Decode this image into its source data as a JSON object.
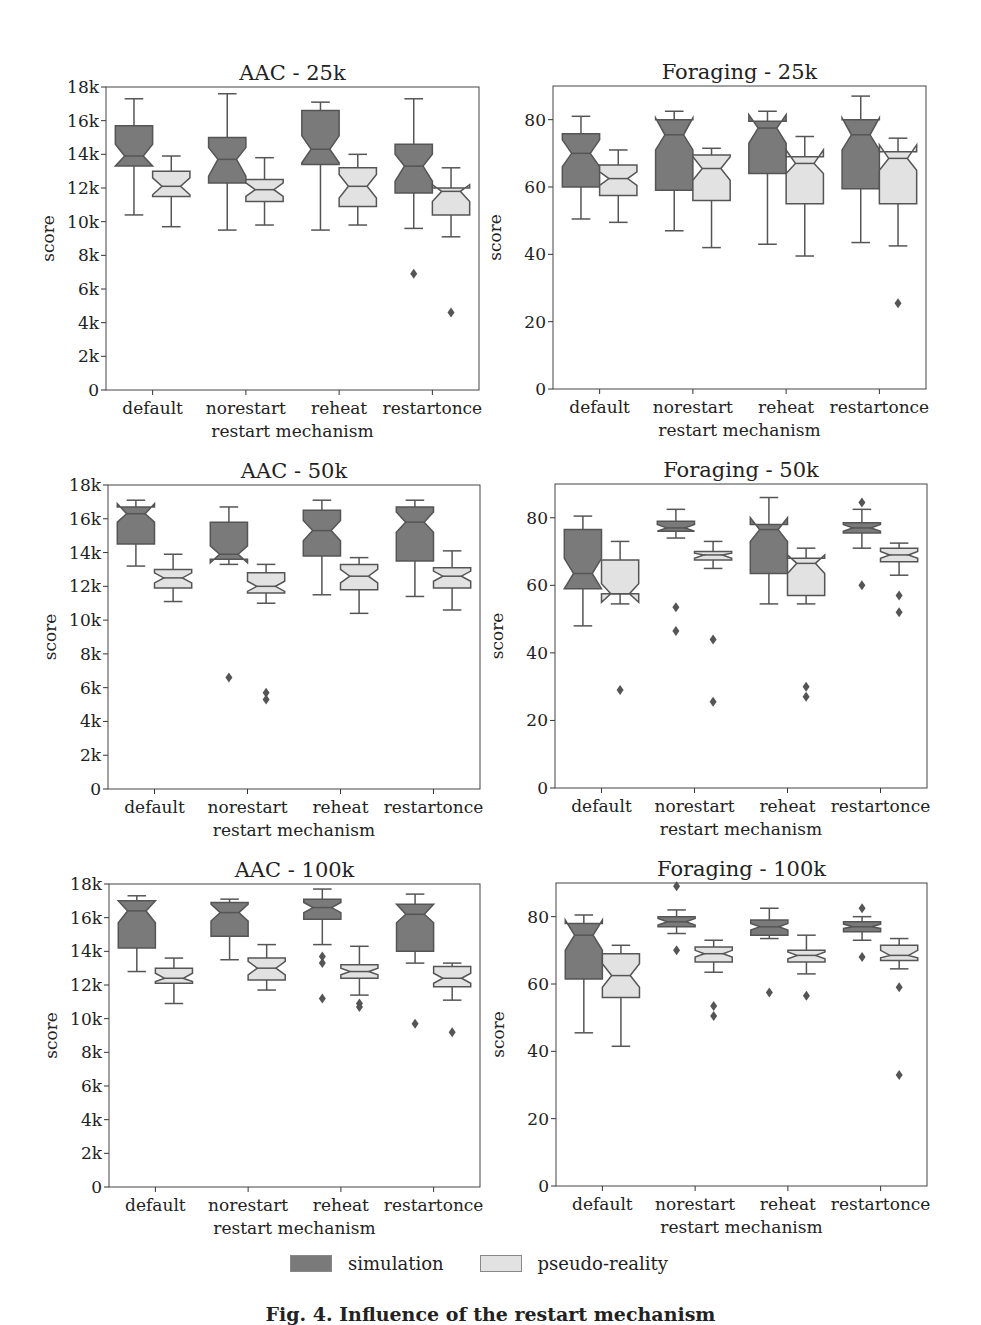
{
  "figure": {
    "caption": "Fig. 4. Influence of the restart mechanism",
    "colors": {
      "simulation": "#7a7a7a",
      "pseudo_reality": "#e2e2e2",
      "edge": "#555555"
    },
    "legend": [
      {
        "label": "simulation",
        "color": "#7a7a7a"
      },
      {
        "label": "pseudo-reality",
        "color": "#e2e2e2"
      }
    ]
  },
  "chart_data": [
    {
      "type": "box",
      "title": "AAC - 25k",
      "xlabel": "restart mechanism",
      "ylabel": "score",
      "ylim": [
        0,
        18000
      ],
      "yticks": [
        0,
        2000,
        4000,
        6000,
        8000,
        10000,
        12000,
        14000,
        16000,
        18000
      ],
      "yticklabels": [
        "0",
        "2k",
        "4k",
        "6k",
        "8k",
        "10k",
        "12k",
        "14k",
        "16k",
        "18k"
      ],
      "categories": [
        "default",
        "norestart",
        "reheat",
        "restartonce"
      ],
      "series": [
        {
          "name": "simulation",
          "boxes": [
            {
              "wlo": 10400,
              "q1": 13300,
              "med": 13900,
              "q3": 15700,
              "whi": 17300,
              "nlo": 13300,
              "nhi": 14600,
              "out": []
            },
            {
              "wlo": 9500,
              "q1": 12300,
              "med": 13700,
              "q3": 15000,
              "whi": 17600,
              "nlo": 12700,
              "nhi": 14400,
              "out": []
            },
            {
              "wlo": 9500,
              "q1": 13400,
              "med": 14300,
              "q3": 16600,
              "whi": 17100,
              "nlo": 13500,
              "nhi": 15100,
              "out": []
            },
            {
              "wlo": 9600,
              "q1": 11700,
              "med": 13300,
              "q3": 14600,
              "whi": 17300,
              "nlo": 12400,
              "nhi": 14000,
              "out": [
                6900
              ]
            }
          ]
        },
        {
          "name": "pseudo-reality",
          "boxes": [
            {
              "wlo": 9700,
              "q1": 11500,
              "med": 12100,
              "q3": 13000,
              "whi": 13900,
              "nlo": 11600,
              "nhi": 12600,
              "out": []
            },
            {
              "wlo": 9800,
              "q1": 11200,
              "med": 11900,
              "q3": 12500,
              "whi": 13800,
              "nlo": 11500,
              "nhi": 12300,
              "out": []
            },
            {
              "wlo": 9800,
              "q1": 10900,
              "med": 12100,
              "q3": 13200,
              "whi": 14000,
              "nlo": 11400,
              "nhi": 12800,
              "out": []
            },
            {
              "wlo": 9100,
              "q1": 10400,
              "med": 11800,
              "q3": 12000,
              "whi": 13200,
              "nlo": 11200,
              "nhi": 12200,
              "out": [
                4600
              ]
            }
          ]
        }
      ]
    },
    {
      "type": "box",
      "title": "Foraging - 25k",
      "xlabel": "restart mechanism",
      "ylabel": "score",
      "ylim": [
        0,
        90
      ],
      "yticks": [
        0,
        20,
        40,
        60,
        80
      ],
      "yticklabels": [
        "0",
        "20",
        "40",
        "60",
        "80"
      ],
      "categories": [
        "default",
        "norestart",
        "reheat",
        "restartonce"
      ],
      "series": [
        {
          "name": "simulation",
          "boxes": [
            {
              "wlo": 50.5,
              "q1": 60,
              "med": 70,
              "q3": 75.8,
              "whi": 81,
              "nlo": 66,
              "nhi": 74,
              "out": []
            },
            {
              "wlo": 47,
              "q1": 59,
              "med": 75.5,
              "q3": 80,
              "whi": 82.5,
              "nlo": 71,
              "nhi": 80.5,
              "out": []
            },
            {
              "wlo": 43,
              "q1": 64,
              "med": 77.5,
              "q3": 79.5,
              "whi": 82.5,
              "nlo": 73,
              "nhi": 81.5,
              "out": []
            },
            {
              "wlo": 43.5,
              "q1": 59.5,
              "med": 75.5,
              "q3": 80,
              "whi": 87,
              "nlo": 71,
              "nhi": 80.5,
              "out": []
            }
          ]
        },
        {
          "name": "pseudo-reality",
          "boxes": [
            {
              "wlo": 49.5,
              "q1": 57.5,
              "med": 62.5,
              "q3": 66.5,
              "whi": 71,
              "nlo": 60.5,
              "nhi": 64.5,
              "out": []
            },
            {
              "wlo": 42,
              "q1": 56,
              "med": 65.5,
              "q3": 69.5,
              "whi": 71.5,
              "nlo": 62,
              "nhi": 69,
              "out": []
            },
            {
              "wlo": 39.5,
              "q1": 55,
              "med": 67,
              "q3": 69,
              "whi": 75,
              "nlo": 64,
              "nhi": 71,
              "out": []
            },
            {
              "wlo": 42.5,
              "q1": 55,
              "med": 68.5,
              "q3": 70.5,
              "whi": 74.5,
              "nlo": 65,
              "nhi": 72.5,
              "out": [
                25.5
              ]
            }
          ]
        }
      ]
    },
    {
      "type": "box",
      "title": "AAC - 50k",
      "xlabel": "restart mechanism",
      "ylabel": "score",
      "ylim": [
        0,
        18000
      ],
      "yticks": [
        0,
        2000,
        4000,
        6000,
        8000,
        10000,
        12000,
        14000,
        16000,
        18000
      ],
      "yticklabels": [
        "0",
        "2k",
        "4k",
        "6k",
        "8k",
        "10k",
        "12k",
        "14k",
        "16k",
        "18k"
      ],
      "categories": [
        "default",
        "norestart",
        "reheat",
        "restartonce"
      ],
      "series": [
        {
          "name": "simulation",
          "boxes": [
            {
              "wlo": 13200,
              "q1": 14500,
              "med": 16300,
              "q3": 16700,
              "whi": 17100,
              "nlo": 15800,
              "nhi": 16900,
              "out": []
            },
            {
              "wlo": 13300,
              "q1": 13600,
              "med": 13900,
              "q3": 15800,
              "whi": 16700,
              "nlo": 13400,
              "nhi": 14400,
              "out": [
                6600
              ]
            },
            {
              "wlo": 11500,
              "q1": 13800,
              "med": 15300,
              "q3": 16500,
              "whi": 17100,
              "nlo": 14700,
              "nhi": 15900,
              "out": []
            },
            {
              "wlo": 11400,
              "q1": 13500,
              "med": 15800,
              "q3": 16700,
              "whi": 17100,
              "nlo": 15200,
              "nhi": 16400,
              "out": []
            }
          ]
        },
        {
          "name": "pseudo-reality",
          "boxes": [
            {
              "wlo": 11100,
              "q1": 11900,
              "med": 12500,
              "q3": 13000,
              "whi": 13900,
              "nlo": 12200,
              "nhi": 12800,
              "out": []
            },
            {
              "wlo": 11000,
              "q1": 11600,
              "med": 12000,
              "q3": 12800,
              "whi": 13300,
              "nlo": 11700,
              "nhi": 12300,
              "out": [
                5300,
                5700
              ]
            },
            {
              "wlo": 10400,
              "q1": 11800,
              "med": 12600,
              "q3": 13300,
              "whi": 13700,
              "nlo": 12200,
              "nhi": 13000,
              "out": []
            },
            {
              "wlo": 10600,
              "q1": 11900,
              "med": 12600,
              "q3": 13100,
              "whi": 14100,
              "nlo": 12300,
              "nhi": 12900,
              "out": []
            }
          ]
        }
      ]
    },
    {
      "type": "box",
      "title": "Foraging - 50k",
      "xlabel": "restart mechanism",
      "ylabel": "score",
      "ylim": [
        0,
        90
      ],
      "yticks": [
        0,
        20,
        40,
        60,
        80
      ],
      "yticklabels": [
        "0",
        "20",
        "40",
        "60",
        "80"
      ],
      "categories": [
        "default",
        "norestart",
        "reheat",
        "restartonce"
      ],
      "series": [
        {
          "name": "simulation",
          "boxes": [
            {
              "wlo": 48,
              "q1": 59,
              "med": 63.5,
              "q3": 76.5,
              "whi": 80.5,
              "nlo": 59,
              "nhi": 68,
              "out": []
            },
            {
              "wlo": 74,
              "q1": 76,
              "med": 77,
              "q3": 79,
              "whi": 82.5,
              "nlo": 76,
              "nhi": 78,
              "out": [
                53.5,
                46.5
              ]
            },
            {
              "wlo": 54.5,
              "q1": 63.5,
              "med": 76.5,
              "q3": 78,
              "whi": 86,
              "nlo": 73,
              "nhi": 80,
              "out": []
            },
            {
              "wlo": 71,
              "q1": 75.5,
              "med": 77,
              "q3": 78.5,
              "whi": 82.5,
              "nlo": 76,
              "nhi": 78,
              "out": [
                60,
                84.5
              ]
            }
          ]
        },
        {
          "name": "pseudo-reality",
          "boxes": [
            {
              "wlo": 54.5,
              "q1": 57.5,
              "med": 57.5,
              "q3": 67.5,
              "whi": 73,
              "nlo": 55,
              "nhi": 60.5,
              "out": [
                29
              ]
            },
            {
              "wlo": 65,
              "q1": 67.5,
              "med": 69,
              "q3": 70,
              "whi": 73,
              "nlo": 68,
              "nhi": 69.5,
              "out": [
                44,
                25.5
              ]
            },
            {
              "wlo": 54.5,
              "q1": 57,
              "med": 66.5,
              "q3": 68,
              "whi": 71,
              "nlo": 63.5,
              "nhi": 69,
              "out": [
                30,
                27
              ]
            },
            {
              "wlo": 63,
              "q1": 67,
              "med": 69,
              "q3": 71,
              "whi": 72.5,
              "nlo": 68,
              "nhi": 70,
              "out": [
                57,
                52
              ]
            }
          ]
        }
      ]
    },
    {
      "type": "box",
      "title": "AAC - 100k",
      "xlabel": "restart mechanism",
      "ylabel": "score",
      "ylim": [
        0,
        18000
      ],
      "yticks": [
        0,
        2000,
        4000,
        6000,
        8000,
        10000,
        12000,
        14000,
        16000,
        18000
      ],
      "yticklabels": [
        "0",
        "2k",
        "4k",
        "6k",
        "8k",
        "10k",
        "12k",
        "14k",
        "16k",
        "18k"
      ],
      "categories": [
        "default",
        "norestart",
        "reheat",
        "restartonce"
      ],
      "series": [
        {
          "name": "simulation",
          "boxes": [
            {
              "wlo": 12800,
              "q1": 14200,
              "med": 16400,
              "q3": 17000,
              "whi": 17300,
              "nlo": 15700,
              "nhi": 17000,
              "out": []
            },
            {
              "wlo": 13500,
              "q1": 14900,
              "med": 16300,
              "q3": 16900,
              "whi": 17100,
              "nlo": 15800,
              "nhi": 16800,
              "out": []
            },
            {
              "wlo": 14400,
              "q1": 15900,
              "med": 16600,
              "q3": 17100,
              "whi": 17700,
              "nlo": 16300,
              "nhi": 16900,
              "out": [
                13700,
                13300,
                11200
              ]
            },
            {
              "wlo": 13300,
              "q1": 14000,
              "med": 16200,
              "q3": 16800,
              "whi": 17400,
              "nlo": 15700,
              "nhi": 16800,
              "out": [
                9700
              ]
            }
          ]
        },
        {
          "name": "pseudo-reality",
          "boxes": [
            {
              "wlo": 10900,
              "q1": 12100,
              "med": 12400,
              "q3": 13000,
              "whi": 13600,
              "nlo": 12200,
              "nhi": 12700,
              "out": []
            },
            {
              "wlo": 11700,
              "q1": 12300,
              "med": 13000,
              "q3": 13600,
              "whi": 14400,
              "nlo": 12600,
              "nhi": 13400,
              "out": []
            },
            {
              "wlo": 11400,
              "q1": 12400,
              "med": 12800,
              "q3": 13200,
              "whi": 14300,
              "nlo": 12600,
              "nhi": 13000,
              "out": [
                10900,
                10700
              ]
            },
            {
              "wlo": 11100,
              "q1": 11900,
              "med": 12400,
              "q3": 13100,
              "whi": 13300,
              "nlo": 12100,
              "nhi": 12700,
              "out": [
                9200
              ]
            }
          ]
        }
      ]
    },
    {
      "type": "box",
      "title": "Foraging - 100k",
      "xlabel": "restart mechanism",
      "ylabel": "score",
      "ylim": [
        0,
        90
      ],
      "yticks": [
        0,
        20,
        40,
        60,
        80
      ],
      "yticklabels": [
        "0",
        "20",
        "40",
        "60",
        "80"
      ],
      "categories": [
        "default",
        "norestart",
        "reheat",
        "restartonce"
      ],
      "series": [
        {
          "name": "simulation",
          "boxes": [
            {
              "wlo": 45.5,
              "q1": 61.5,
              "med": 74.5,
              "q3": 78,
              "whi": 80.5,
              "nlo": 70,
              "nhi": 79,
              "out": []
            },
            {
              "wlo": 75,
              "q1": 77,
              "med": 78.5,
              "q3": 80,
              "whi": 82,
              "nlo": 77.5,
              "nhi": 79.5,
              "out": [
                70,
                89
              ]
            },
            {
              "wlo": 73.5,
              "q1": 74.5,
              "med": 77,
              "q3": 79,
              "whi": 82.5,
              "nlo": 76,
              "nhi": 78,
              "out": [
                57.5
              ]
            },
            {
              "wlo": 73,
              "q1": 75.5,
              "med": 77,
              "q3": 78.5,
              "whi": 80,
              "nlo": 76.5,
              "nhi": 77.8,
              "out": [
                68,
                82.5
              ]
            }
          ]
        },
        {
          "name": "pseudo-reality",
          "boxes": [
            {
              "wlo": 41.5,
              "q1": 56,
              "med": 62.5,
              "q3": 69,
              "whi": 71.5,
              "nlo": 59,
              "nhi": 66,
              "out": []
            },
            {
              "wlo": 63.5,
              "q1": 66.5,
              "med": 69,
              "q3": 71,
              "whi": 73,
              "nlo": 68,
              "nhi": 70,
              "out": [
                53.5,
                50.5
              ]
            },
            {
              "wlo": 63,
              "q1": 66.5,
              "med": 68.5,
              "q3": 70,
              "whi": 74.5,
              "nlo": 67.5,
              "nhi": 69.5,
              "out": [
                56.5
              ]
            },
            {
              "wlo": 64.5,
              "q1": 67,
              "med": 68.5,
              "q3": 71.5,
              "whi": 73.5,
              "nlo": 67.8,
              "nhi": 70,
              "out": [
                59,
                33
              ]
            }
          ]
        }
      ]
    }
  ]
}
